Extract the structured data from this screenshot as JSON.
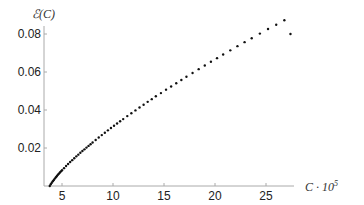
{
  "chart_data": {
    "type": "scatter",
    "title": "",
    "xlabel": "C · 10^5",
    "ylabel": "ℰ(C)",
    "xlim": [
      3.2,
      27.6
    ],
    "ylim": [
      0,
      0.085
    ],
    "x_ticks": [
      5,
      10,
      15,
      20,
      25
    ],
    "x_tick_labels": [
      "5",
      "10",
      "15",
      "20",
      "25"
    ],
    "y_ticks": [
      0.02,
      0.04,
      0.06,
      0.08
    ],
    "y_tick_labels": [
      "0.02",
      "0.04",
      "0.06",
      "0.08"
    ],
    "grid": false,
    "legend": null,
    "series": [
      {
        "name": "E(C)",
        "color": "#111111",
        "x": [
          3.8,
          3.9,
          4.0,
          4.1,
          4.2,
          4.3,
          4.4,
          4.5,
          4.6,
          4.7,
          4.8,
          4.9,
          5.0,
          5.2,
          5.4,
          5.6,
          5.8,
          6.0,
          6.2,
          6.4,
          6.6,
          6.8,
          7.0,
          7.2,
          7.4,
          7.6,
          7.8,
          8.0,
          8.3,
          8.6,
          8.9,
          9.2,
          9.5,
          9.8,
          10.1,
          10.4,
          10.7,
          11.0,
          11.4,
          11.8,
          12.2,
          12.6,
          13.0,
          13.4,
          13.8,
          14.2,
          14.7,
          15.2,
          15.7,
          16.2,
          16.7,
          17.2,
          17.8,
          18.4,
          19.0,
          19.6,
          20.2,
          20.8,
          21.5,
          22.2,
          22.9,
          23.6,
          24.4,
          25.2,
          26.0,
          26.8,
          27.4
        ],
        "y": [
          0.0,
          0.0009,
          0.0017,
          0.0025,
          0.0032,
          0.0039,
          0.0046,
          0.0053,
          0.0059,
          0.0065,
          0.0071,
          0.0077,
          0.0083,
          0.0094,
          0.0105,
          0.0116,
          0.0126,
          0.0136,
          0.0146,
          0.0156,
          0.0165,
          0.0175,
          0.0184,
          0.0193,
          0.0202,
          0.0211,
          0.022,
          0.0229,
          0.0242,
          0.0255,
          0.0268,
          0.028,
          0.0293,
          0.0305,
          0.0317,
          0.0329,
          0.0341,
          0.0352,
          0.0368,
          0.0383,
          0.0398,
          0.0413,
          0.0428,
          0.0443,
          0.0457,
          0.0472,
          0.0489,
          0.0507,
          0.0524,
          0.0541,
          0.0558,
          0.0575,
          0.0595,
          0.0615,
          0.0634,
          0.0654,
          0.0673,
          0.0692,
          0.0714,
          0.0736,
          0.0757,
          0.0778,
          0.0802,
          0.0826,
          0.0849,
          0.0872,
          0.08
        ]
      }
    ]
  },
  "labels": {
    "y_axis_title": "ℰ(C)",
    "x_axis_title": "C · 10",
    "x_axis_exponent": "5"
  }
}
